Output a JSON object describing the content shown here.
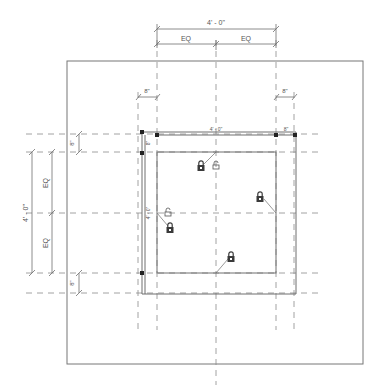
{
  "drawing": {
    "type": "plan-view-dimension-detail",
    "line_color": "#6e6e6e",
    "dash_color": "#8a8a8a",
    "lock_color": "#3a3a3a",
    "dimensions": {
      "top_overall": "4' - 0\"",
      "top_eq_left": "EQ",
      "top_eq_right": "EQ",
      "top_offset_left": "8\"",
      "top_offset_right": "8\"",
      "inner_top": "4' - 0\"",
      "inner_top_right": "8\"",
      "left_overall": "4' - 0\"",
      "left_eq_top": "EQ",
      "left_eq_bottom": "EQ",
      "left_offset_top": "8\"",
      "left_offset_bottom": "8\"",
      "inner_left_small": "8\"",
      "inner_left": "4' - 0\""
    },
    "icons": {
      "lock": "lock-icon",
      "unlock": "unlock-icon"
    }
  }
}
